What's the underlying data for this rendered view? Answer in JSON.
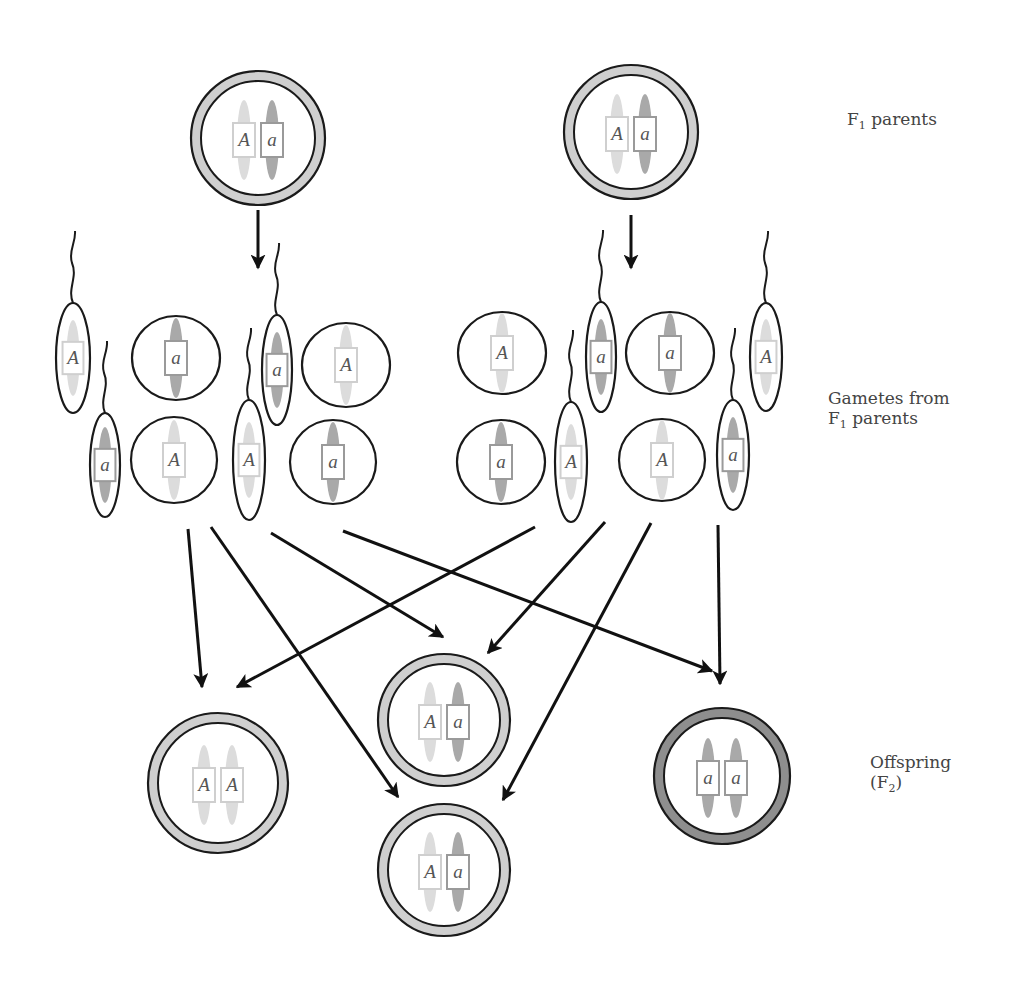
{
  "labels": {
    "parents": {
      "prefix": "F",
      "sub": "1",
      "suffix": " parents"
    },
    "gametes": {
      "line1": "Gametes from",
      "line2_prefix": "F",
      "line2_sub": "1",
      "line2_suffix": " parents"
    },
    "offspring": {
      "line1": "Offspring",
      "line2_prefix": "(F",
      "line2_sub": "2",
      "line2_suffix": ")"
    }
  },
  "colors": {
    "ring_light": "#cfcfcf",
    "ring_dark": "#8e8e8e",
    "outline": "#1a1a1a",
    "chrom_dominant": "#dcdcdc",
    "chrom_recessive": "#a9a9a9",
    "box_dominant": "#cfcfcf",
    "box_recessive": "#9a9a9a",
    "arrow": "#111111"
  },
  "parents": [
    {
      "id": "parent-left",
      "genotype": [
        "A",
        "a"
      ],
      "cx": 258,
      "cy": 138,
      "r": 67
    },
    {
      "id": "parent-right",
      "genotype": [
        "A",
        "a"
      ],
      "cx": 631,
      "cy": 132,
      "r": 67
    }
  ],
  "gametes": [
    {
      "side": "left",
      "type": "sperm",
      "allele": "A",
      "cx": 73,
      "cy": 358,
      "rx": 17,
      "ry": 55
    },
    {
      "side": "left",
      "type": "egg",
      "allele": "a",
      "cx": 176,
      "cy": 358,
      "rx": 44,
      "ry": 42
    },
    {
      "side": "left",
      "type": "sperm",
      "allele": "a",
      "cx": 277,
      "cy": 370,
      "rx": 15,
      "ry": 55
    },
    {
      "side": "left",
      "type": "egg",
      "allele": "A",
      "cx": 346,
      "cy": 365,
      "rx": 44,
      "ry": 42
    },
    {
      "side": "left",
      "type": "sperm",
      "allele": "a",
      "cx": 105,
      "cy": 465,
      "rx": 15,
      "ry": 52
    },
    {
      "side": "left",
      "type": "egg",
      "allele": "A",
      "cx": 174,
      "cy": 460,
      "rx": 43,
      "ry": 43
    },
    {
      "side": "left",
      "type": "sperm",
      "allele": "A",
      "cx": 249,
      "cy": 460,
      "rx": 16,
      "ry": 60
    },
    {
      "side": "left",
      "type": "egg",
      "allele": "a",
      "cx": 333,
      "cy": 462,
      "rx": 43,
      "ry": 42
    },
    {
      "side": "right",
      "type": "egg",
      "allele": "A",
      "cx": 502,
      "cy": 353,
      "rx": 44,
      "ry": 41
    },
    {
      "side": "right",
      "type": "sperm",
      "allele": "a",
      "cx": 601,
      "cy": 357,
      "rx": 15,
      "ry": 55
    },
    {
      "side": "right",
      "type": "egg",
      "allele": "a",
      "cx": 670,
      "cy": 353,
      "rx": 44,
      "ry": 41
    },
    {
      "side": "right",
      "type": "sperm",
      "allele": "A",
      "cx": 766,
      "cy": 357,
      "rx": 16,
      "ry": 54
    },
    {
      "side": "right",
      "type": "egg",
      "allele": "a",
      "cx": 501,
      "cy": 462,
      "rx": 44,
      "ry": 42
    },
    {
      "side": "right",
      "type": "sperm",
      "allele": "A",
      "cx": 571,
      "cy": 462,
      "rx": 16,
      "ry": 60
    },
    {
      "side": "right",
      "type": "egg",
      "allele": "A",
      "cx": 662,
      "cy": 460,
      "rx": 43,
      "ry": 41
    },
    {
      "side": "right",
      "type": "sperm",
      "allele": "a",
      "cx": 733,
      "cy": 455,
      "rx": 16,
      "ry": 55
    }
  ],
  "offspring": [
    {
      "id": "offspring-AA",
      "genotype": [
        "A",
        "A"
      ],
      "cx": 218,
      "cy": 783,
      "r": 70,
      "ring": "light"
    },
    {
      "id": "offspring-Aa-top",
      "genotype": [
        "A",
        "a"
      ],
      "cx": 444,
      "cy": 720,
      "r": 66,
      "ring": "light"
    },
    {
      "id": "offspring-aa",
      "genotype": [
        "a",
        "a"
      ],
      "cx": 722,
      "cy": 776,
      "r": 68,
      "ring": "dark"
    },
    {
      "id": "offspring-Aa-bottom",
      "genotype": [
        "A",
        "a"
      ],
      "cx": 444,
      "cy": 870,
      "r": 66,
      "ring": "light"
    }
  ],
  "arrows": [
    {
      "from": [
        258,
        210
      ],
      "to": [
        258,
        268
      ]
    },
    {
      "from": [
        631,
        215
      ],
      "to": [
        631,
        268
      ]
    },
    {
      "from": [
        188,
        529
      ],
      "to": [
        202,
        687
      ]
    },
    {
      "from": [
        211,
        527
      ],
      "to": [
        398,
        797
      ]
    },
    {
      "from": [
        271,
        533
      ],
      "to": [
        443,
        637
      ]
    },
    {
      "from": [
        343,
        531
      ],
      "to": [
        712,
        671
      ]
    },
    {
      "from": [
        535,
        527
      ],
      "to": [
        237,
        687
      ]
    },
    {
      "from": [
        605,
        522
      ],
      "to": [
        488,
        653
      ]
    },
    {
      "from": [
        651,
        523
      ],
      "to": [
        503,
        800
      ]
    },
    {
      "from": [
        718,
        525
      ],
      "to": [
        720,
        684
      ]
    }
  ]
}
